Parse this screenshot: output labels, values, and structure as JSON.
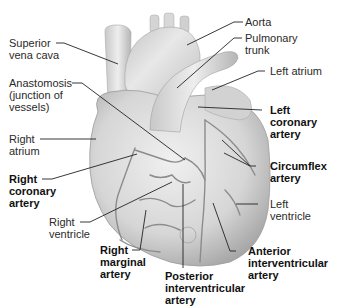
{
  "figure": {
    "colors": {
      "background": "#ffffff",
      "heart_fill": "#d9d9d9",
      "heart_shadow": "#9a9a9a",
      "vessel": "#8a8a8a",
      "leader_line": "#222222",
      "label_text": "#2a2a2a"
    }
  },
  "labels": {
    "superior_vena_cava": "Superior\nvena cava",
    "anastomosis": "Anastomosis\n(junction of\nvessels)",
    "right_atrium": "Right\natrium",
    "right_coronary_artery": "Right\ncoronary\nartery",
    "right_ventricle": "Right\nventricle",
    "right_marginal_artery": "Right\nmarginal\nartery",
    "posterior_interventricular_artery": "Posterior\ninterventricular\nartery",
    "anterior_interventricular_artery": "Anterior\ninterventricular\nartery",
    "left_ventricle": "Left\nventricle",
    "circumflex_artery": "Circumflex\nartery",
    "left_coronary_artery": "Left\ncoronary\nartery",
    "left_atrium": "Left atrium",
    "pulmonary_trunk": "Pulmonary\ntrunk",
    "aorta": "Aorta"
  }
}
